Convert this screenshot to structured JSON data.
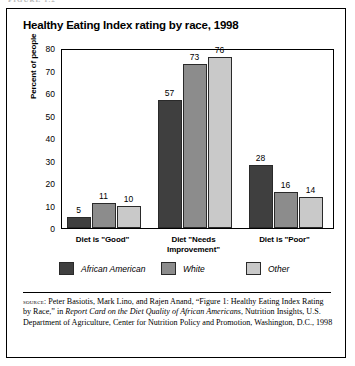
{
  "page_header": "FIGURE 1.2",
  "card": {
    "title": "Healthy Eating Index rating by race, 1998"
  },
  "chart_data": {
    "type": "bar",
    "title": "Healthy Eating Index rating by race, 1998",
    "xlabel": "",
    "ylabel": "Percent of people",
    "ylim": [
      0,
      80
    ],
    "yticks": [
      0,
      10,
      20,
      30,
      40,
      50,
      60,
      70,
      80
    ],
    "grid": false,
    "legend_position": "bottom",
    "categories": [
      "Diet is \"Good\"",
      "Diet \"Needs\nImprovement\"",
      "Diet is \"Poor\""
    ],
    "series": [
      {
        "name": "African American",
        "color": "#3f3f3f",
        "values": [
          5,
          57,
          28
        ]
      },
      {
        "name": "White",
        "color": "#8c8c8c",
        "values": [
          11,
          73,
          16
        ]
      },
      {
        "name": "Other",
        "color": "#c9c9c9",
        "values": [
          10,
          76,
          14
        ]
      }
    ]
  },
  "source": {
    "label": "source:",
    "line1": " Peter Basiotis, Mark Lino, and Rajen Anand, “Figure 1: Healthy Eating Index Rating by Race,” in ",
    "italic1": "Report Card on the Diet Quality of African Americans",
    "line2": ", Nutrition Insights, U.S. Department of Agriculture, Center for Nutrition Policy and Promotion, Washington, D.C., 1998"
  }
}
